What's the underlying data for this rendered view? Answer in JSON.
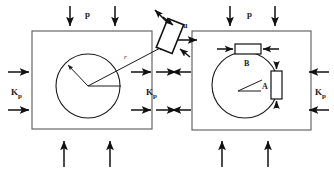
{
  "figure": {
    "background_color": "#ffffff",
    "line_color": "#1a1a1a",
    "frame_color": "#5a5a5a"
  },
  "labels": {
    "pressure_top_left": "p",
    "pressure_top_right": "p",
    "kp_left_outer": "K",
    "kp_left_outer_sub": "p",
    "kp_left_inner": "K",
    "kp_left_inner_sub": "p",
    "kp_right_outer": "K",
    "kp_right_outer_sub": "p",
    "radius": "r",
    "displacement": "u",
    "element_a": "A",
    "element_b": "B"
  },
  "left_panel": {
    "name": "initial-state-panel",
    "square": {
      "x": 32,
      "y": 31,
      "width": 120,
      "height": 98
    },
    "circle": {
      "cx": 88,
      "cy": 86,
      "r": 32
    },
    "radius_arrow": {
      "from": [
        88,
        86
      ],
      "to": [
        66,
        63
      ]
    },
    "horizontal_radius": {
      "from": [
        88,
        86
      ],
      "to": [
        122,
        86
      ]
    },
    "r_leader": {
      "from": [
        88,
        86
      ],
      "to": [
        166,
        45
      ]
    }
  },
  "right_panel": {
    "name": "deformed-state-panel",
    "square": {
      "x": 192,
      "y": 31,
      "width": 119,
      "height": 99
    },
    "circle": {
      "cx": 245,
      "cy": 85,
      "r": 33
    },
    "element_b_box": {
      "x": 235,
      "y": 44,
      "width": 26,
      "height": 10
    },
    "element_a_box": {
      "x": 271,
      "y": 71,
      "width": 11,
      "height": 28
    },
    "angle_vertex": [
      239,
      91
    ],
    "angle_arm_1": [
      262,
      81
    ],
    "angle_arm_2": [
      262,
      91
    ]
  },
  "rotated_element": {
    "name": "stress-element",
    "center": [
      170,
      36
    ],
    "width": 17,
    "height": 31,
    "rotation_deg": 22
  },
  "arrows": {
    "top_left_down": [
      [
        70,
        6,
        70,
        27
      ],
      [
        115,
        6,
        115,
        27
      ]
    ],
    "top_right_down": [
      [
        230,
        6,
        230,
        27
      ],
      [
        275,
        6,
        275,
        27
      ]
    ],
    "bottom_left_up": [
      [
        64,
        168,
        64,
        140
      ],
      [
        110,
        168,
        110,
        140
      ]
    ],
    "bottom_right_up": [
      [
        222,
        168,
        222,
        140
      ],
      [
        268,
        168,
        268,
        140
      ]
    ],
    "left_outer_right": [
      [
        8,
        72,
        30,
        72
      ],
      [
        8,
        110,
        30,
        110
      ]
    ],
    "left_inner_right": [
      [
        128,
        110,
        152,
        110
      ]
    ],
    "mid_left_in": [
      [
        130,
        72,
        152,
        72
      ]
    ],
    "mid_right_out": [
      [
        155,
        72,
        176,
        72
      ],
      [
        155,
        110,
        176,
        110
      ]
    ],
    "right_inner_left": [
      [
        190,
        72,
        168,
        72
      ]
    ],
    "right_outer_left": [
      [
        330,
        72,
        308,
        72
      ],
      [
        330,
        110,
        308,
        110
      ]
    ],
    "u_arrow": [
      [
        178,
        40,
        199,
        40
      ]
    ]
  }
}
